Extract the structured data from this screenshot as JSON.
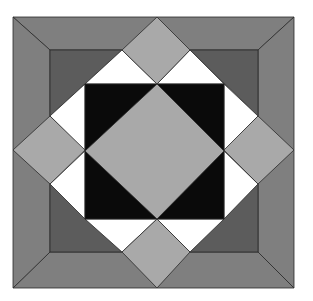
{
  "image": {
    "description": "Quilt block pattern: square-in-a-square with corner diamonds",
    "width": 313,
    "height": 301
  },
  "colors": {
    "outer_border": "#7f7f7f",
    "inner_ring": "#5c5c5c",
    "diamond": "#a9a9a9",
    "center_square": "#0a0a0a",
    "white": "#ffffff",
    "outline": "#2a2a2a"
  },
  "shapes": [
    {
      "name": "outer-border-top",
      "fill": "outer_border",
      "points": "13,17 294,17 258,50 50,50"
    },
    {
      "name": "outer-border-right",
      "fill": "outer_border",
      "points": "294,17 294,288 258,252 258,50"
    },
    {
      "name": "outer-border-bottom",
      "fill": "outer_border",
      "points": "13,288 294,288 258,252 50,252"
    },
    {
      "name": "outer-border-left",
      "fill": "outer_border",
      "points": "13,17 50,50 50,252 13,288"
    },
    {
      "name": "inner-ring-top-left",
      "fill": "inner_ring",
      "points": "50,50 122,50 50,116"
    },
    {
      "name": "inner-ring-top-right",
      "fill": "inner_ring",
      "points": "190,50 258,50 258,116"
    },
    {
      "name": "inner-ring-bottom-right",
      "fill": "inner_ring",
      "points": "258,184 258,252 190,252"
    },
    {
      "name": "inner-ring-bottom-left",
      "fill": "inner_ring",
      "points": "50,184 122,252 50,252"
    },
    {
      "name": "white-top-left-a",
      "fill": "white",
      "points": "122,50 157,84 85,84"
    },
    {
      "name": "white-top-left-b",
      "fill": "white",
      "points": "50,116 85,84 85,151"
    },
    {
      "name": "white-top-right-a",
      "fill": "white",
      "points": "190,50 224,84 157,84"
    },
    {
      "name": "white-top-right-b",
      "fill": "white",
      "points": "258,116 224,151 224,84"
    },
    {
      "name": "white-bottom-right-a",
      "fill": "white",
      "points": "258,184 224,219 224,151"
    },
    {
      "name": "white-bottom-right-b",
      "fill": "white",
      "points": "190,252 157,219 224,219"
    },
    {
      "name": "white-bottom-left-a",
      "fill": "white",
      "points": "122,252 85,219 157,219"
    },
    {
      "name": "white-bottom-left-b",
      "fill": "white",
      "points": "50,184 85,151 85,219"
    },
    {
      "name": "center-square",
      "fill": "center_square",
      "points": "85,84 224,84 224,219 85,219"
    },
    {
      "name": "center-diamond",
      "fill": "diamond",
      "points": "157,84 224,151 157,219 85,151"
    },
    {
      "name": "top-diamond",
      "fill": "diamond",
      "points": "157,17 190,50 157,84 122,50"
    },
    {
      "name": "right-diamond",
      "fill": "diamond",
      "points": "258,116 294,150 258,184 224,150"
    },
    {
      "name": "bottom-diamond",
      "fill": "diamond",
      "points": "157,219 190,252 157,288 122,252"
    },
    {
      "name": "left-diamond",
      "fill": "diamond",
      "points": "50,116 85,150 50,184 13,150"
    }
  ]
}
